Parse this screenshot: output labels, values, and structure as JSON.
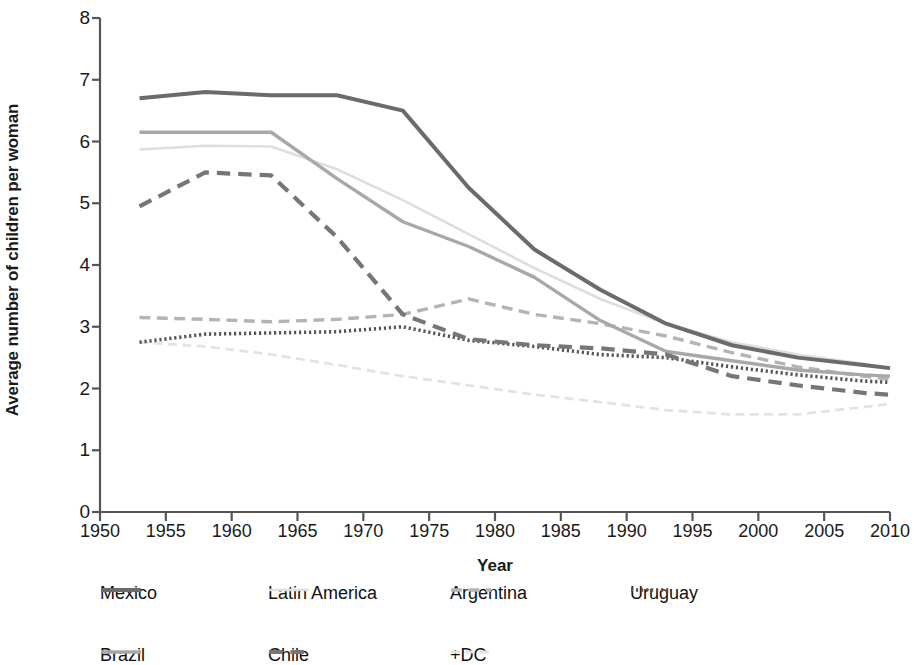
{
  "chart_data": {
    "type": "line",
    "title": "",
    "xlabel": "Year",
    "ylabel": "Average number of children per woman",
    "xlim": [
      1950,
      2010
    ],
    "ylim": [
      0,
      8
    ],
    "xticks": [
      1950,
      1955,
      1960,
      1965,
      1970,
      1975,
      1980,
      1985,
      1990,
      1995,
      2000,
      2005,
      2010
    ],
    "yticks": [
      0,
      1,
      2,
      3,
      4,
      5,
      6,
      7,
      8
    ],
    "grid": false,
    "legend_position": "bottom",
    "x": [
      1953,
      1958,
      1963,
      1968,
      1973,
      1978,
      1983,
      1988,
      1993,
      1998,
      2003,
      2008,
      2010
    ],
    "series": [
      {
        "name": "Mexico",
        "style": "solid",
        "color": "#6b6b6b",
        "width": 4.0,
        "values": [
          6.7,
          6.8,
          6.75,
          6.75,
          6.5,
          5.25,
          4.25,
          3.6,
          3.05,
          2.7,
          2.5,
          2.38,
          2.33
        ]
      },
      {
        "name": "Brazil",
        "style": "solid",
        "color": "#a8a8a8",
        "width": 3.4,
        "values": [
          6.15,
          6.15,
          6.15,
          5.4,
          4.7,
          4.3,
          3.8,
          3.1,
          2.6,
          2.45,
          2.3,
          2.22,
          2.2
        ]
      },
      {
        "name": "Latin America",
        "style": "solid",
        "color": "#dedede",
        "width": 2.6,
        "values": [
          5.87,
          5.93,
          5.92,
          5.55,
          5.05,
          4.5,
          3.95,
          3.45,
          3.05,
          2.75,
          2.55,
          2.4,
          2.32
        ]
      },
      {
        "name": "Chile",
        "style": "dashed",
        "color": "#767676",
        "width": 4.2,
        "values": [
          4.95,
          5.5,
          5.45,
          4.45,
          3.2,
          2.8,
          2.7,
          2.65,
          2.55,
          2.2,
          2.05,
          1.93,
          1.9
        ]
      },
      {
        "name": "Argentina",
        "style": "dashed",
        "color": "#b4b4b4",
        "width": 3.4,
        "values": [
          3.15,
          3.12,
          3.08,
          3.12,
          3.2,
          3.45,
          3.2,
          3.05,
          2.85,
          2.58,
          2.35,
          2.2,
          2.15
        ]
      },
      {
        "name": "Uruguay",
        "style": "dotted",
        "color": "#555555",
        "width": 3.6,
        "values": [
          2.75,
          2.88,
          2.9,
          2.92,
          3.0,
          2.78,
          2.68,
          2.55,
          2.5,
          2.35,
          2.22,
          2.12,
          2.1
        ]
      },
      {
        "name": "+DC",
        "style": "dashed",
        "color": "#e3e3e3",
        "width": 2.8,
        "values": [
          2.75,
          2.68,
          2.55,
          2.38,
          2.2,
          2.05,
          1.9,
          1.78,
          1.65,
          1.58,
          1.58,
          1.7,
          1.75
        ]
      }
    ]
  },
  "legend": {
    "rows": [
      [
        {
          "label": "Mexico",
          "series": "Mexico"
        },
        {
          "label": "Latin America",
          "series": "Latin America"
        },
        {
          "label": "Argentina",
          "series": "Argentina"
        },
        {
          "label": "Uruguay",
          "series": "Uruguay"
        }
      ],
      [
        {
          "label": "Brazil",
          "series": "Brazil"
        },
        {
          "label": "Chile",
          "series": "Chile"
        },
        {
          "label": "+DC",
          "series": "+DC"
        }
      ]
    ]
  },
  "axis": {
    "line_color": "#555555"
  }
}
